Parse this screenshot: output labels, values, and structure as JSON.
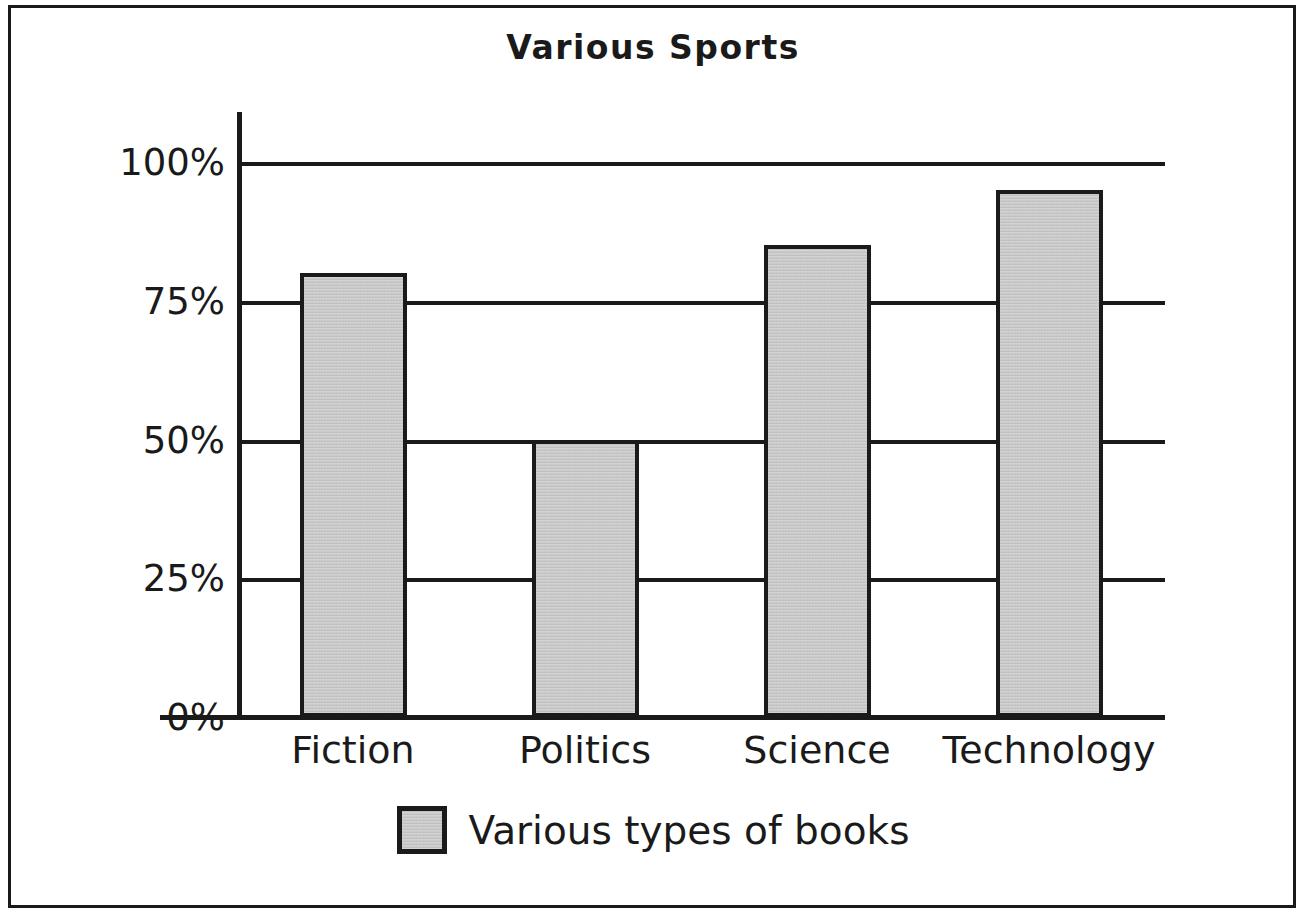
{
  "chart_data": {
    "type": "bar",
    "title": "Various Sports",
    "xlabel": "",
    "ylabel": "",
    "categories": [
      "Fiction",
      "Politics",
      "Science",
      "Technology"
    ],
    "values": [
      80,
      50,
      85,
      95
    ],
    "series": [
      {
        "name": "Various types of books",
        "values": [
          80,
          50,
          85,
          95
        ]
      }
    ],
    "ylim": [
      0,
      100
    ],
    "ytick_values": [
      0,
      25,
      50,
      75,
      100
    ],
    "ytick_labels": [
      "0%",
      "25%",
      "50%",
      "75%",
      "100%"
    ],
    "grid": true,
    "legend_position": "bottom",
    "legend_entries": [
      {
        "label": "Various types of books",
        "swatch_color": "#c3c3c3",
        "swatch_border": "#1a1a1a"
      }
    ],
    "colors": {
      "bar_fill": "#c3c3c3",
      "bar_stroke": "#1a1a1a",
      "axis": "#1a1a1a",
      "grid": "#1a1a1a",
      "text": "#1a1a1a",
      "background": "#ffffff",
      "frame": "#1a1a1a"
    }
  }
}
